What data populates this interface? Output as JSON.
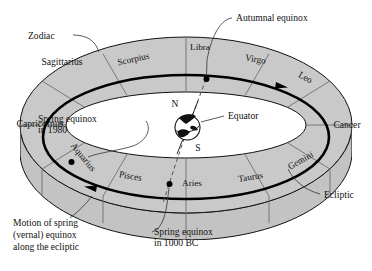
{
  "figure": {
    "background_color": "#ffffff",
    "band_fill_color": "#c9c9c9",
    "band_front_fill_color": "#c3c3c3",
    "inner_fill_color": "#ffffff",
    "line_color": "#111111",
    "ecliptic_color": "#000000",
    "divider_color": "#6e6e6e"
  },
  "callouts": {
    "zodiac": "Zodiac",
    "autumnal_equinox": "Autumnal equinox",
    "equator": "Equator",
    "ecliptic": "Ecliptic",
    "spring_equinox_1980_line1": "Spring equinox",
    "spring_equinox_1980_line2": "in 1980",
    "spring_equinox_1000bc_line1": "Spring equinox",
    "spring_equinox_1000bc_line2": "in 1000 BC"
  },
  "caption": {
    "line1": "Motion of spring",
    "line2": "(vernal) equinox",
    "line3": "along the ecliptic"
  },
  "earth": {
    "north_pole_label": "N",
    "south_pole_label": "S"
  },
  "constellations_outside": [
    {
      "name": "Sagittarius",
      "position": "upper-left"
    },
    {
      "name": "Capricornus",
      "position": "left"
    },
    {
      "name": "Cancer",
      "position": "right"
    }
  ],
  "constellations_band": [
    {
      "name": "Scorpius",
      "position": "back-upper-left"
    },
    {
      "name": "Libra",
      "position": "back-top"
    },
    {
      "name": "Virgo",
      "position": "back-upper-right"
    },
    {
      "name": "Leo",
      "position": "back-right"
    },
    {
      "name": "Gemini",
      "position": "front-right"
    },
    {
      "name": "Taurus",
      "position": "front-lower-right"
    },
    {
      "name": "Aries",
      "position": "front-bottom"
    },
    {
      "name": "Pisces",
      "position": "front-lower-left"
    },
    {
      "name": "Aquarius",
      "position": "front-left"
    }
  ],
  "markers": [
    {
      "name": "autumnal-equinox-point",
      "label": "Autumnal equinox"
    },
    {
      "name": "spring-equinox-1000bc-point",
      "label": "Spring equinox in 1000 BC"
    },
    {
      "name": "spring-equinox-1980-point",
      "label": "Spring equinox in 1980"
    }
  ]
}
